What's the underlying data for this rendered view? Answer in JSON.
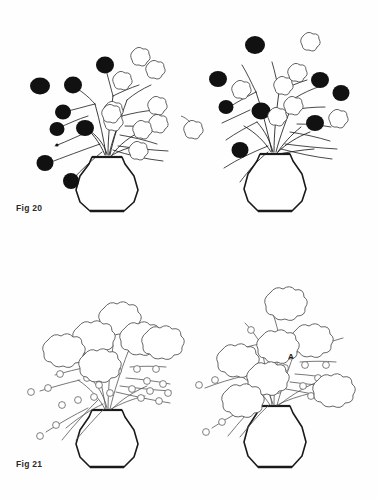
{
  "page": {
    "background_color": "#fefefe",
    "ink_color": "#1a1a1a",
    "dark_flower_color": "#111111",
    "light_flower_color": "#ffffff"
  },
  "figures": [
    {
      "id": "fig-20",
      "label": "Fig 20",
      "label_x": 16,
      "label_y": 203,
      "arrangements": [
        {
          "id": "fig20-left",
          "vase": {
            "cx": 107,
            "top_y": 156,
            "base_y": 212
          },
          "dark_flower_count": 8,
          "light_flower_count": 8,
          "description": "Vase of branches with dark blooms on the left side and outlined blooms on the right side"
        },
        {
          "id": "fig20-right",
          "vase": {
            "cx": 275,
            "top_y": 153,
            "base_y": 212
          },
          "dark_flower_count": 8,
          "light_flower_count": 7,
          "description": "Vase of branches with dark and outlined blooms intermixed across the whole arrangement"
        }
      ],
      "detached_flower": {
        "x": 193,
        "y": 133,
        "type": "light"
      }
    },
    {
      "id": "fig-21",
      "label": "Fig 21",
      "label_x": 16,
      "label_y": 459,
      "arrangements": [
        {
          "id": "fig21-left",
          "vase": {
            "cx": 107,
            "top_y": 408,
            "base_y": 468
          },
          "dark_flower_count": 0,
          "light_flower_count": 6,
          "bud_count": 22,
          "description": "Vase of budded branches with large outlined blossoms clustered in the upper centre"
        },
        {
          "id": "fig21-right",
          "vase": {
            "cx": 275,
            "top_y": 404,
            "base_y": 468
          },
          "dark_flower_count": 0,
          "light_flower_count": 7,
          "bud_count": 24,
          "description": "Vase of budded branches with outlined blossoms spread evenly and an annotated point A"
        }
      ],
      "annotations": [
        {
          "text": "A",
          "x": 288,
          "y": 352,
          "target": "fig21-right"
        }
      ]
    }
  ]
}
